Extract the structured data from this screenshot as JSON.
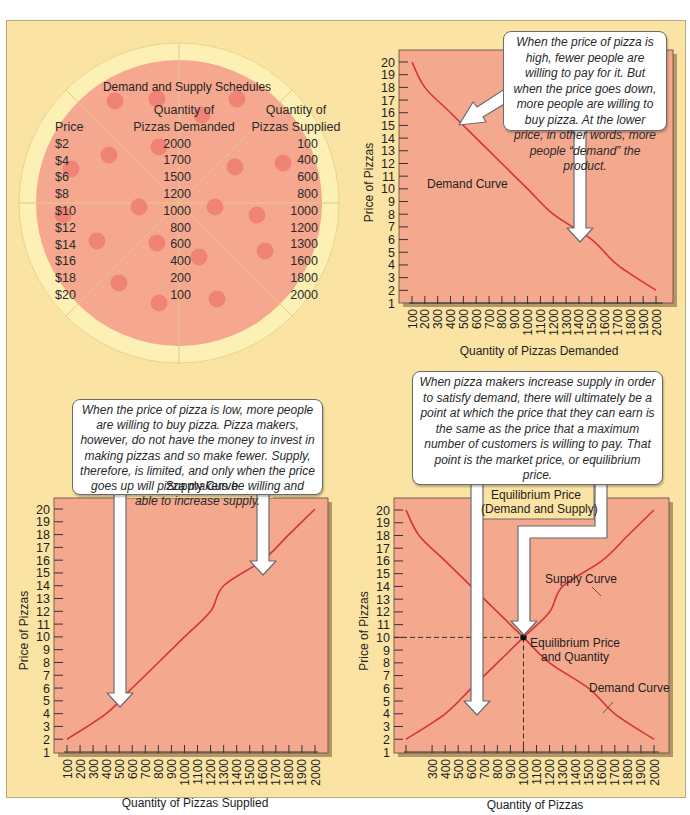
{
  "schedule": {
    "title": "Demand and Supply Schedules",
    "headers": {
      "price": "Price",
      "demanded": [
        "Quantity of",
        "Pizzas Demanded"
      ],
      "supplied": [
        "Quantity of",
        "Pizzas Supplied"
      ]
    },
    "rows": [
      {
        "price": "$2",
        "demanded": "2000",
        "supplied": "100"
      },
      {
        "price": "$4",
        "demanded": "1700",
        "supplied": "400"
      },
      {
        "price": "$6",
        "demanded": "1500",
        "supplied": "600"
      },
      {
        "price": "$8",
        "demanded": "1200",
        "supplied": "800"
      },
      {
        "price": "$10",
        "demanded": "1000",
        "supplied": "1000"
      },
      {
        "price": "$12",
        "demanded": "800",
        "supplied": "1200"
      },
      {
        "price": "$14",
        "demanded": "600",
        "supplied": "1300"
      },
      {
        "price": "$16",
        "demanded": "400",
        "supplied": "1600"
      },
      {
        "price": "$18",
        "demanded": "200",
        "supplied": "1800"
      },
      {
        "price": "$20",
        "demanded": "100",
        "supplied": "2000"
      }
    ]
  },
  "callouts": {
    "demand": "When the price of pizza is high, fewer people are willing to pay for it. But when the price goes down, more people are willing to buy pizza. At the lower price, in other words, more people “demand” the product.",
    "supply": "When the price of pizza is low, more people are willing to buy pizza. Pizza makers, however, do not have the money to invest in making pizzas and so make fewer. Supply, therefore, is limited, and only when the price goes up will pizza makers be willing and able to increase supply.",
    "equilibrium": "When pizza makers increase supply in order to satisfy demand, there will ultimately be a point at which the price that they can earn is the same as the price that a maximum number of customers is willing to pay. That point is the market price, or equilibrium price."
  },
  "colors": {
    "background": "#fbe3a3",
    "plot_area": "#f4a98f",
    "curve": "#d9323a",
    "pizza_crust": "#fdf0b4",
    "pizza_sauce": "#f5a88f",
    "pepperoni": "#ee7f73"
  },
  "chart_data": [
    {
      "id": "demand",
      "type": "line",
      "title": "",
      "xlabel": "Quantity of Pizzas Demanded",
      "ylabel": "Price of Pizzas",
      "x_ticks": [
        "100",
        "200",
        "300",
        "400",
        "500",
        "600",
        "700",
        "800",
        "900",
        "1000",
        "1100",
        "1200",
        "1300",
        "1400",
        "1500",
        "1600",
        "1700",
        "1800",
        "1900",
        "2000"
      ],
      "y_ticks": [
        "1",
        "2",
        "3",
        "4",
        "5",
        "6",
        "7",
        "8",
        "9",
        "10",
        "11",
        "12",
        "13",
        "14",
        "15",
        "16",
        "17",
        "18",
        "19",
        "20"
      ],
      "ylim": [
        1,
        20
      ],
      "xlim": [
        100,
        2000
      ],
      "grid": false,
      "series": [
        {
          "name": "Demand Curve",
          "x": [
            100,
            200,
            400,
            600,
            800,
            1000,
            1200,
            1500,
            1700,
            2000
          ],
          "y": [
            20,
            18,
            16,
            14,
            12,
            10,
            8,
            6,
            4,
            2
          ]
        }
      ],
      "annotations": [
        "Demand Curve"
      ]
    },
    {
      "id": "supply",
      "type": "line",
      "title": "Supply Curve",
      "xlabel": "Quantity of Pizzas Supplied",
      "ylabel": "Price of Pizzas",
      "x_ticks": [
        "100",
        "200",
        "300",
        "400",
        "500",
        "600",
        "700",
        "800",
        "900",
        "1000",
        "1100",
        "1200",
        "1300",
        "1400",
        "1500",
        "1600",
        "1700",
        "1800",
        "1900",
        "2000"
      ],
      "y_ticks": [
        "1",
        "2",
        "3",
        "4",
        "5",
        "6",
        "7",
        "8",
        "9",
        "10",
        "11",
        "12",
        "13",
        "14",
        "15",
        "16",
        "17",
        "18",
        "19",
        "20"
      ],
      "ylim": [
        1,
        20
      ],
      "xlim": [
        100,
        2000
      ],
      "grid": false,
      "series": [
        {
          "name": "Supply Curve",
          "x": [
            100,
            400,
            600,
            800,
            1000,
            1200,
            1300,
            1600,
            1800,
            2000
          ],
          "y": [
            2,
            4,
            6,
            8,
            10,
            12,
            14,
            16,
            18,
            20
          ]
        }
      ]
    },
    {
      "id": "equilibrium",
      "type": "line",
      "title": "Equilibrium Price (Demand and Supply)",
      "xlabel": "Quantity of Pizzas",
      "ylabel": "Price of Pizzas",
      "x_ticks": [
        "300",
        "400",
        "500",
        "600",
        "700",
        "800",
        "900",
        "1000",
        "1100",
        "1200",
        "1300",
        "1400",
        "1500",
        "1600",
        "1700",
        "1800",
        "1900",
        "2000"
      ],
      "y_ticks": [
        "1",
        "2",
        "3",
        "4",
        "5",
        "6",
        "7",
        "8",
        "9",
        "10",
        "11",
        "12",
        "13",
        "14",
        "15",
        "16",
        "17",
        "18",
        "19",
        "20"
      ],
      "ylim": [
        1,
        20
      ],
      "xlim": [
        100,
        2000
      ],
      "grid": false,
      "series": [
        {
          "name": "Supply Curve",
          "x": [
            100,
            400,
            600,
            800,
            1000,
            1200,
            1300,
            1600,
            1800,
            2000
          ],
          "y": [
            2,
            4,
            6,
            8,
            10,
            12,
            14,
            16,
            18,
            20
          ]
        },
        {
          "name": "Demand Curve",
          "x": [
            100,
            200,
            400,
            600,
            800,
            1000,
            1200,
            1500,
            1700,
            2000
          ],
          "y": [
            20,
            18,
            16,
            14,
            12,
            10,
            8,
            6,
            4,
            2
          ]
        }
      ],
      "equilibrium_point": {
        "x": 1000,
        "y": 10,
        "label": "Equilibrium Price and Quantity"
      },
      "annotations": [
        "Supply Curve",
        "Demand Curve",
        "Equilibrium Price and Quantity"
      ]
    }
  ],
  "labels": {
    "demand_curve": "Demand Curve",
    "supply_curve": "Supply Curve",
    "eq_supply_curve": "Supply Curve",
    "eq_demand_curve": "Demand Curve",
    "eq_title_line1": "Equilibrium Price",
    "eq_title_line2": "(Demand and Supply)",
    "eq_point_line1": "Equilibrium Price",
    "eq_point_line2": "and Quantity",
    "price_axis": "Price of Pizzas",
    "x_demand": "Quantity of Pizzas Demanded",
    "x_supply": "Quantity of Pizzas Supplied",
    "x_eq": "Quantity of Pizzas"
  }
}
